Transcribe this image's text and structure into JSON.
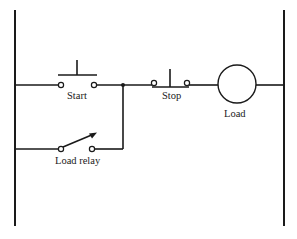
{
  "diagram": {
    "type": "ladder-logic",
    "labels": {
      "start": "Start",
      "stop": "Stop",
      "load": "Load",
      "load_relay": "Load relay"
    },
    "components": [
      {
        "id": "start",
        "kind": "normally-open pushbutton",
        "rung": 1
      },
      {
        "id": "stop",
        "kind": "normally-closed pushbutton",
        "rung": 1
      },
      {
        "id": "load",
        "kind": "coil",
        "rung": 1
      },
      {
        "id": "load_relay",
        "kind": "normally-open relay contact (seal-in)",
        "rung": 2,
        "parallel_with": "start"
      }
    ],
    "colors": {
      "ink": "#1a1a1a",
      "background": "#ffffff"
    }
  }
}
